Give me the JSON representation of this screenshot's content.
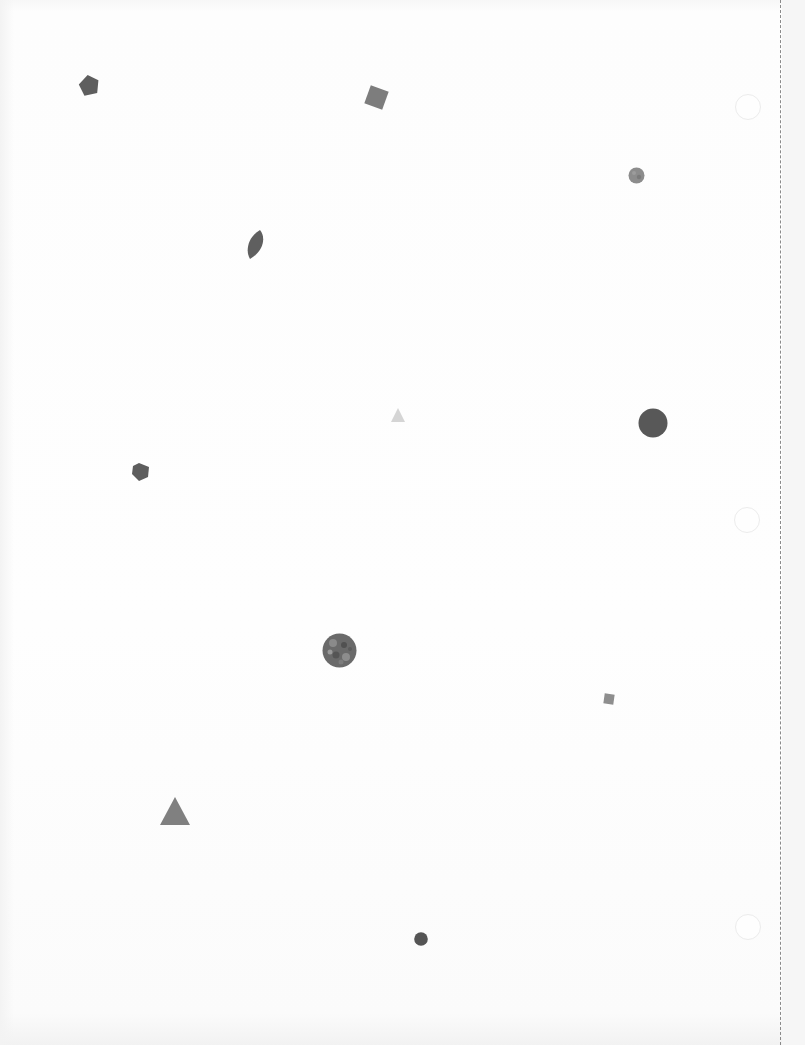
{
  "page": {
    "background": "#fdfdfd",
    "perforation_color": "#8a8a8a"
  },
  "holes": [
    {
      "name": "hole-top",
      "x": 735,
      "y": 94
    },
    {
      "name": "hole-middle",
      "x": 734,
      "y": 507
    },
    {
      "name": "hole-bottom",
      "x": 735,
      "y": 914
    }
  ],
  "shapes": [
    {
      "name": "pentagon",
      "icon": "pentagon-icon",
      "x": 78,
      "y": 74,
      "w": 22,
      "h": 22,
      "color": "#5e5e5e"
    },
    {
      "name": "square",
      "icon": "square-icon",
      "x": 363,
      "y": 84,
      "w": 27,
      "h": 27,
      "color": "#7d7d7d"
    },
    {
      "name": "circle-textured-small",
      "icon": "circle-icon",
      "x": 628,
      "y": 167,
      "w": 17,
      "h": 17,
      "color": "#8c8c8c"
    },
    {
      "name": "leaf",
      "icon": "leaf-icon",
      "x": 246,
      "y": 229,
      "w": 20,
      "h": 31,
      "color": "#5f5f5f"
    },
    {
      "name": "triangle-light",
      "icon": "triangle-icon",
      "x": 391,
      "y": 408,
      "w": 14,
      "h": 14,
      "color": "#d5d5d5"
    },
    {
      "name": "circle-large",
      "icon": "circle-icon",
      "x": 638,
      "y": 408,
      "w": 30,
      "h": 30,
      "color": "#585858"
    },
    {
      "name": "pentagon-small",
      "icon": "pentagon-icon",
      "x": 131,
      "y": 463,
      "w": 19,
      "h": 18,
      "color": "#5d5d5d"
    },
    {
      "name": "circle-textured-large",
      "icon": "circle-icon",
      "x": 322,
      "y": 633,
      "w": 35,
      "h": 35,
      "color": "#6a6a6a"
    },
    {
      "name": "square-small",
      "icon": "square-icon",
      "x": 603,
      "y": 693,
      "w": 12,
      "h": 12,
      "color": "#8e8e8e"
    },
    {
      "name": "triangle",
      "icon": "triangle-icon",
      "x": 160,
      "y": 797,
      "w": 30,
      "h": 28,
      "color": "#808080"
    },
    {
      "name": "circle-small",
      "icon": "circle-icon",
      "x": 414,
      "y": 932,
      "w": 14,
      "h": 14,
      "color": "#545454"
    }
  ]
}
